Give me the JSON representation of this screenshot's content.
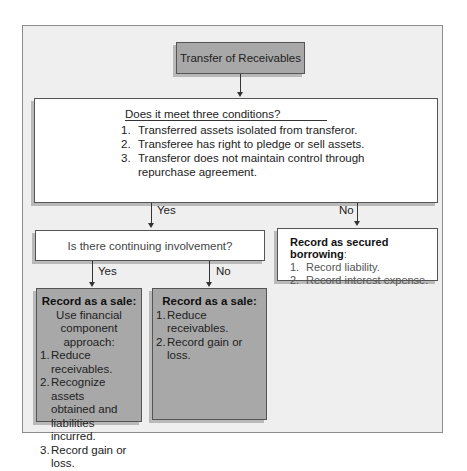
{
  "diagram": {
    "title": "Transfer of Receivables",
    "conditions": {
      "question": "Does it meet three conditions?",
      "items": [
        {
          "num": "1.",
          "text": "Transferred assets isolated from transferor."
        },
        {
          "num": "2.",
          "text": "Transferee has right to pledge or sell assets."
        },
        {
          "num": "3.",
          "text": "Transferor does not maintain control through"
        },
        {
          "num": "",
          "text": "repurchase agreement."
        }
      ]
    },
    "edges": {
      "conditions_yes": "Yes",
      "conditions_no": "No",
      "involvement_yes": "Yes",
      "involvement_no": "No"
    },
    "involvement": {
      "question": "Is there continuing involvement?"
    },
    "secured_borrowing": {
      "title": "Record as secured borrowing",
      "title_suffix": ":",
      "items": [
        {
          "num": "1.",
          "text": "Record liability."
        },
        {
          "num": "2.",
          "text": "Record interest expense."
        }
      ]
    },
    "sale_with_involvement": {
      "title": "Record as a sale:",
      "subtitle_lines": [
        "Use financial",
        "component",
        "approach:"
      ],
      "items": [
        {
          "num": "1.",
          "text": "Reduce receivables."
        },
        {
          "num": "2.",
          "text": "Recognize assets"
        },
        {
          "num": "",
          "text": "obtained and"
        },
        {
          "num": "",
          "text": "liabilities incurred."
        },
        {
          "num": "3.",
          "text": "Record gain or loss."
        }
      ]
    },
    "sale_no_involvement": {
      "title": "Record as a sale:",
      "items": [
        {
          "num": "1.",
          "text": "Reduce receivables."
        },
        {
          "num": "2.",
          "text": "Record gain or loss."
        }
      ]
    },
    "colors": {
      "frame_bg": "#efefef",
      "gray_box": "#a8a8a8",
      "white_box": "#ffffff",
      "border": "#555555"
    }
  }
}
